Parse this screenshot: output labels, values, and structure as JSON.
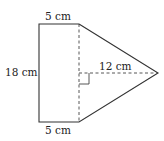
{
  "diagram": {
    "shape": "rectangle-plus-triangle composite figure",
    "labels": {
      "top_width": "5 cm",
      "bottom_width": "5 cm",
      "height": "18 cm",
      "triangle_height": "12 cm"
    },
    "colors": {
      "stroke": "#333333",
      "dashed": "#444444",
      "text": "#222222"
    }
  }
}
